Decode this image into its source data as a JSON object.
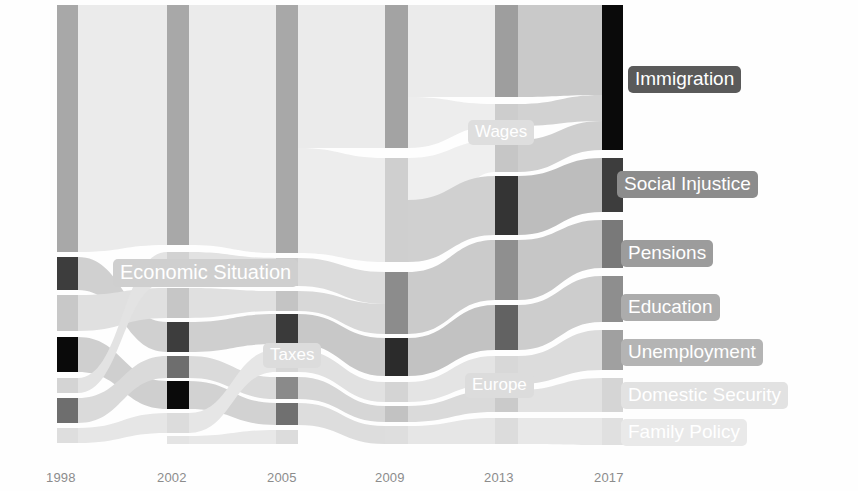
{
  "chart_data": {
    "type": "sankey",
    "title": "",
    "xlabel": "",
    "ylabel": "",
    "grid": false,
    "legend_position": "right-inline",
    "axis": {
      "ticks": [
        "1998",
        "2002",
        "2005",
        "2009",
        "2013",
        "2017"
      ],
      "tick_x": [
        46,
        157,
        267,
        375,
        484,
        594
      ],
      "tick_y": 470
    },
    "columns": [
      {
        "year": "1998",
        "x": 57,
        "width": 21,
        "nodes": [
          {
            "name": "Economic Situation",
            "y": 5,
            "h": 247,
            "color": "#a8a8a8"
          },
          {
            "name": "Unemployment",
            "y": 257,
            "h": 33,
            "color": "#3d3d3d"
          },
          {
            "name": "Pensions",
            "y": 295,
            "h": 36,
            "color": "#c8c8c8"
          },
          {
            "name": "Social Injustice",
            "y": 337,
            "h": 35,
            "color": "#0a0a0a"
          },
          {
            "name": "Education",
            "y": 378,
            "h": 15,
            "color": "#d4d4d4"
          },
          {
            "name": "Immigration",
            "y": 398,
            "h": 25,
            "color": "#6e6e6e"
          },
          {
            "name": "Family Policy",
            "y": 428,
            "h": 15,
            "color": "#dedede"
          }
        ]
      },
      {
        "year": "2002",
        "x": 167,
        "width": 22,
        "nodes": [
          {
            "name": "Economic Situation",
            "y": 5,
            "h": 240,
            "color": "#a8a8a8"
          },
          {
            "name": "Taxes",
            "y": 252,
            "h": 30,
            "color": "#d2d2d2"
          },
          {
            "name": "Pensions",
            "y": 288,
            "h": 30,
            "color": "#c6c6c6"
          },
          {
            "name": "Unemployment",
            "y": 322,
            "h": 30,
            "color": "#3d3d3d"
          },
          {
            "name": "Immigration",
            "y": 356,
            "h": 22,
            "color": "#6e6e6e"
          },
          {
            "name": "Social Injustice",
            "y": 381,
            "h": 28,
            "color": "#0a0a0a"
          },
          {
            "name": "Domestic Security",
            "y": 413,
            "h": 20,
            "color": "#dcdcdc"
          },
          {
            "name": "Family Policy",
            "y": 436,
            "h": 8,
            "color": "#e4e4e4"
          }
        ]
      },
      {
        "year": "2005",
        "x": 276,
        "width": 22,
        "nodes": [
          {
            "name": "Economic Situation",
            "y": 5,
            "h": 248,
            "color": "#a8a8a8"
          },
          {
            "name": "Taxes",
            "y": 258,
            "h": 28,
            "color": "#cccccc"
          },
          {
            "name": "Pensions",
            "y": 291,
            "h": 20,
            "color": "#c4c4c4"
          },
          {
            "name": "Unemployment",
            "y": 314,
            "h": 30,
            "color": "#3a3a3a"
          },
          {
            "name": "Education",
            "y": 350,
            "h": 22,
            "color": "#d6d6d6"
          },
          {
            "name": "Immigration",
            "y": 377,
            "h": 22,
            "color": "#8a8a8a"
          },
          {
            "name": "Social Injustice",
            "y": 403,
            "h": 22,
            "color": "#707070"
          },
          {
            "name": "Family Policy",
            "y": 430,
            "h": 14,
            "color": "#dcdcdc"
          }
        ]
      },
      {
        "year": "2009",
        "x": 385,
        "width": 23,
        "nodes": [
          {
            "name": "Economic Situation",
            "y": 5,
            "h": 143,
            "color": "#a3a3a3"
          },
          {
            "name": "Wages",
            "y": 158,
            "h": 104,
            "color": "#cfcfcf"
          },
          {
            "name": "Pensions",
            "y": 272,
            "h": 62,
            "color": "#8c8c8c"
          },
          {
            "name": "Unemployment",
            "y": 338,
            "h": 38,
            "color": "#2b2b2b"
          },
          {
            "name": "Education",
            "y": 382,
            "h": 20,
            "color": "#d4d4d4"
          },
          {
            "name": "Immigration",
            "y": 406,
            "h": 16,
            "color": "#c2c2c2"
          },
          {
            "name": "Family Policy",
            "y": 426,
            "h": 18,
            "color": "#dedede"
          }
        ]
      },
      {
        "year": "2013",
        "x": 495,
        "width": 23,
        "nodes": [
          {
            "name": "Economic Situation",
            "y": 5,
            "h": 92,
            "color": "#9e9e9e"
          },
          {
            "name": "Wages",
            "y": 104,
            "h": 22,
            "color": "#cdcdcd"
          },
          {
            "name": "Education",
            "y": 140,
            "h": 32,
            "color": "#c6c6c6"
          },
          {
            "name": "Social Injustice",
            "y": 176,
            "h": 59,
            "color": "#343434"
          },
          {
            "name": "Pensions",
            "y": 240,
            "h": 60,
            "color": "#8f8f8f"
          },
          {
            "name": "Unemployment",
            "y": 305,
            "h": 45,
            "color": "#626262"
          },
          {
            "name": "Europe",
            "y": 356,
            "h": 28,
            "color": "#d8d8d8"
          },
          {
            "name": "Immigration",
            "y": 390,
            "h": 22,
            "color": "#cacaca"
          },
          {
            "name": "Family Policy",
            "y": 418,
            "h": 26,
            "color": "#dcdcdc"
          }
        ]
      },
      {
        "year": "2017",
        "x": 602,
        "width": 21,
        "nodes": [
          {
            "name": "Immigration",
            "y": 5,
            "h": 145,
            "color": "#0a0a0a"
          },
          {
            "name": "Social Injustice",
            "y": 158,
            "h": 54,
            "color": "#3d3d3d"
          },
          {
            "name": "Pensions",
            "y": 220,
            "h": 48,
            "color": "#797979"
          },
          {
            "name": "Education",
            "y": 276,
            "h": 46,
            "color": "#8e8e8e"
          },
          {
            "name": "Unemployment",
            "y": 330,
            "h": 40,
            "color": "#a0a0a0"
          },
          {
            "name": "Domestic Security",
            "y": 378,
            "h": 34,
            "color": "#d5d5d5"
          },
          {
            "name": "Family Policy",
            "y": 418,
            "h": 27,
            "color": "#e0e0e0"
          }
        ]
      }
    ],
    "flows": [
      {
        "from": "1998:Economic Situation",
        "to": "2002:Economic Situation",
        "x0": 78,
        "y0": 5,
        "h0": 247,
        "x1": 167,
        "y1": 5,
        "h1": 240,
        "color": "#ebebeb"
      },
      {
        "from": "1998:Unemployment",
        "to": "2002:Unemployment",
        "x0": 78,
        "y0": 257,
        "h0": 33,
        "x1": 167,
        "y1": 322,
        "h1": 30,
        "color": "#d0d0d0"
      },
      {
        "from": "1998:Pensions",
        "to": "2002:Pensions",
        "x0": 78,
        "y0": 295,
        "h0": 36,
        "x1": 167,
        "y1": 288,
        "h1": 30,
        "color": "#e0e0e0"
      },
      {
        "from": "1998:Social Injustice",
        "to": "2002:Social Injustice",
        "x0": 78,
        "y0": 337,
        "h0": 35,
        "x1": 167,
        "y1": 381,
        "h1": 28,
        "color": "#cfcfcf"
      },
      {
        "from": "1998:Education",
        "to": "2002:Taxes",
        "x0": 78,
        "y0": 378,
        "h0": 15,
        "x1": 167,
        "y1": 252,
        "h1": 30,
        "color": "#e3e3e3"
      },
      {
        "from": "1998:Immigration",
        "to": "2002:Immigration",
        "x0": 78,
        "y0": 398,
        "h0": 25,
        "x1": 167,
        "y1": 356,
        "h1": 22,
        "color": "#dadada"
      },
      {
        "from": "1998:Family Policy",
        "to": "2002:Domestic Security",
        "x0": 78,
        "y0": 428,
        "h0": 15,
        "x1": 167,
        "y1": 413,
        "h1": 20,
        "color": "#e6e6e6"
      },
      {
        "from": "2002:Economic Situation",
        "to": "2005:Economic Situation",
        "x0": 189,
        "y0": 5,
        "h0": 240,
        "x1": 276,
        "y1": 5,
        "h1": 248,
        "color": "#ebebeb"
      },
      {
        "from": "2002:Taxes",
        "to": "2005:Taxes",
        "x0": 189,
        "y0": 252,
        "h0": 30,
        "x1": 276,
        "y1": 258,
        "h1": 28,
        "color": "#e2e2e2"
      },
      {
        "from": "2002:Pensions",
        "to": "2005:Pensions",
        "x0": 189,
        "y0": 288,
        "h0": 30,
        "x1": 276,
        "y1": 291,
        "h1": 20,
        "color": "#e0e0e0"
      },
      {
        "from": "2002:Unemployment",
        "to": "2005:Unemployment",
        "x0": 189,
        "y0": 322,
        "h0": 30,
        "x1": 276,
        "y1": 314,
        "h1": 30,
        "color": "#cfcfcf"
      },
      {
        "from": "2002:Immigration",
        "to": "2005:Immigration",
        "x0": 189,
        "y0": 356,
        "h0": 22,
        "x1": 276,
        "y1": 377,
        "h1": 22,
        "color": "#dadada"
      },
      {
        "from": "2002:Social Injustice",
        "to": "2005:Social Injustice",
        "x0": 189,
        "y0": 381,
        "h0": 28,
        "x1": 276,
        "y1": 403,
        "h1": 22,
        "color": "#d2d2d2"
      },
      {
        "from": "2002:Domestic Security",
        "to": "2005:Education",
        "x0": 189,
        "y0": 413,
        "h0": 20,
        "x1": 276,
        "y1": 350,
        "h1": 22,
        "color": "#e6e6e6"
      },
      {
        "from": "2002:Family Policy",
        "to": "2005:Family Policy",
        "x0": 189,
        "y0": 436,
        "h0": 8,
        "x1": 276,
        "y1": 430,
        "h1": 14,
        "color": "#e8e8e8"
      },
      {
        "from": "2005:Economic Situation",
        "to": "2009:Economic Situation",
        "x0": 298,
        "y0": 5,
        "h0": 143,
        "x1": 385,
        "y1": 5,
        "h1": 143,
        "color": "#ebebeb"
      },
      {
        "from": "2005:Economic Situation",
        "to": "2009:Wages",
        "x0": 298,
        "y0": 148,
        "h0": 105,
        "x1": 385,
        "y1": 158,
        "h1": 104,
        "color": "#ededed"
      },
      {
        "from": "2005:Taxes",
        "to": "2009:Pensions",
        "x0": 298,
        "y0": 258,
        "h0": 28,
        "x1": 385,
        "y1": 272,
        "h1": 32,
        "color": "#dcdcdc"
      },
      {
        "from": "2005:Pensions",
        "to": "2009:Pensions",
        "x0": 298,
        "y0": 291,
        "h0": 20,
        "x1": 385,
        "y1": 304,
        "h1": 30,
        "color": "#d8d8d8"
      },
      {
        "from": "2005:Unemployment",
        "to": "2009:Unemployment",
        "x0": 298,
        "y0": 314,
        "h0": 30,
        "x1": 385,
        "y1": 338,
        "h1": 38,
        "color": "#c8c8c8"
      },
      {
        "from": "2005:Education",
        "to": "2009:Education",
        "x0": 298,
        "y0": 350,
        "h0": 22,
        "x1": 385,
        "y1": 382,
        "h1": 20,
        "color": "#e1e1e1"
      },
      {
        "from": "2005:Immigration",
        "to": "2009:Immigration",
        "x0": 298,
        "y0": 377,
        "h0": 22,
        "x1": 385,
        "y1": 406,
        "h1": 16,
        "color": "#d6d6d6"
      },
      {
        "from": "2005:Social Injustice",
        "to": "2009:Family Policy",
        "x0": 298,
        "y0": 403,
        "h0": 22,
        "x1": 385,
        "y1": 426,
        "h1": 18,
        "color": "#dddddd"
      },
      {
        "from": "2009:Economic Situation",
        "to": "2013:Economic Situation",
        "x0": 408,
        "y0": 5,
        "h0": 92,
        "x1": 495,
        "y1": 5,
        "h1": 92,
        "color": "#ebebeb"
      },
      {
        "from": "2009:Economic Situation",
        "to": "2013:Wages",
        "x0": 408,
        "y0": 97,
        "h0": 51,
        "x1": 495,
        "y1": 104,
        "h1": 22,
        "color": "#ededed"
      },
      {
        "from": "2009:Wages",
        "to": "2013:Education",
        "x0": 408,
        "y0": 158,
        "h0": 104,
        "x1": 495,
        "y1": 140,
        "h1": 32,
        "color": "#efefef"
      },
      {
        "from": "2009:Wages",
        "to": "2013:Social Injustice",
        "x0": 408,
        "y0": 200,
        "h0": 62,
        "x1": 495,
        "y1": 176,
        "h1": 59,
        "color": "#d0d0d0"
      },
      {
        "from": "2009:Pensions",
        "to": "2013:Pensions",
        "x0": 408,
        "y0": 272,
        "h0": 62,
        "x1": 495,
        "y1": 240,
        "h1": 60,
        "color": "#cbcbcb"
      },
      {
        "from": "2009:Unemployment",
        "to": "2013:Unemployment",
        "x0": 408,
        "y0": 338,
        "h0": 38,
        "x1": 495,
        "y1": 305,
        "h1": 45,
        "color": "#c2c2c2"
      },
      {
        "from": "2009:Education",
        "to": "2013:Europe",
        "x0": 408,
        "y0": 382,
        "h0": 20,
        "x1": 495,
        "y1": 356,
        "h1": 28,
        "color": "#e4e4e4"
      },
      {
        "from": "2009:Immigration",
        "to": "2013:Immigration",
        "x0": 408,
        "y0": 406,
        "h0": 16,
        "x1": 495,
        "y1": 390,
        "h1": 22,
        "color": "#dadada"
      },
      {
        "from": "2009:Family Policy",
        "to": "2013:Family Policy",
        "x0": 408,
        "y0": 426,
        "h0": 18,
        "x1": 495,
        "y1": 418,
        "h1": 26,
        "color": "#e6e6e6"
      },
      {
        "from": "2013:Economic Situation",
        "to": "2017:Immigration",
        "x0": 518,
        "y0": 5,
        "h0": 92,
        "x1": 602,
        "y1": 5,
        "h1": 90,
        "color": "#c9c9c9"
      },
      {
        "from": "2013:Wages",
        "to": "2017:Immigration",
        "x0": 518,
        "y0": 104,
        "h0": 22,
        "x1": 602,
        "y1": 95,
        "h1": 26,
        "color": "#d2d2d2"
      },
      {
        "from": "2013:Education",
        "to": "2017:Immigration",
        "x0": 518,
        "y0": 140,
        "h0": 32,
        "x1": 602,
        "y1": 121,
        "h1": 29,
        "color": "#cfcfcf"
      },
      {
        "from": "2013:Social Injustice",
        "to": "2017:Social Injustice",
        "x0": 518,
        "y0": 176,
        "h0": 59,
        "x1": 602,
        "y1": 158,
        "h1": 54,
        "color": "#bdbdbd"
      },
      {
        "from": "2013:Pensions",
        "to": "2017:Pensions",
        "x0": 518,
        "y0": 240,
        "h0": 60,
        "x1": 602,
        "y1": 220,
        "h1": 48,
        "color": "#c6c6c6"
      },
      {
        "from": "2013:Unemployment",
        "to": "2017:Education",
        "x0": 518,
        "y0": 305,
        "h0": 45,
        "x1": 602,
        "y1": 276,
        "h1": 46,
        "color": "#cdcdcd"
      },
      {
        "from": "2013:Europe",
        "to": "2017:Unemployment",
        "x0": 518,
        "y0": 356,
        "h0": 28,
        "x1": 602,
        "y1": 330,
        "h1": 40,
        "color": "#dcdcdc"
      },
      {
        "from": "2013:Immigration",
        "to": "2017:Domestic Security",
        "x0": 518,
        "y0": 390,
        "h0": 22,
        "x1": 602,
        "y1": 378,
        "h1": 34,
        "color": "#e2e2e2"
      },
      {
        "from": "2013:Family Policy",
        "to": "2017:Family Policy",
        "x0": 518,
        "y0": 418,
        "h0": 26,
        "x1": 602,
        "y1": 418,
        "h1": 27,
        "color": "#e8e8e8"
      }
    ]
  },
  "labels": {
    "right": [
      {
        "text": "Immigration",
        "x": 628,
        "y": 66,
        "bg": "#5a5a5a",
        "fg": "#ffffff"
      },
      {
        "text": "Social Injustice",
        "x": 617,
        "y": 171,
        "bg": "#8c8c8c",
        "fg": "#ffffff"
      },
      {
        "text": "Pensions",
        "x": 621,
        "y": 240,
        "bg": "#9c9c9c",
        "fg": "#ffffff"
      },
      {
        "text": "Education",
        "x": 621,
        "y": 294,
        "bg": "#acacac",
        "fg": "#ffffff"
      },
      {
        "text": "Unemployment",
        "x": 621,
        "y": 339,
        "bg": "#b4b4b4",
        "fg": "#ffffff"
      },
      {
        "text": "Domestic Security",
        "x": 621,
        "y": 382,
        "bg": "#e2e2e2",
        "fg": "#ffffff"
      },
      {
        "text": "Family Policy",
        "x": 621,
        "y": 419,
        "bg": "#e9e9e9",
        "fg": "#ffffff"
      }
    ],
    "inline": [
      {
        "text": "Economic Situation",
        "x": 113,
        "y": 259,
        "bg": "#cfcfcf",
        "fg": "#ffffff",
        "size": 20
      },
      {
        "text": "Taxes",
        "x": 263,
        "y": 343,
        "bg": "#dcdcdc",
        "fg": "#ffffff",
        "size": 17
      },
      {
        "text": "Wages",
        "x": 468,
        "y": 120,
        "bg": "#dedede",
        "fg": "#ffffff",
        "size": 17
      },
      {
        "text": "Europe",
        "x": 465,
        "y": 373,
        "bg": "#dcdcdc",
        "fg": "#ffffff",
        "size": 17
      }
    ]
  }
}
